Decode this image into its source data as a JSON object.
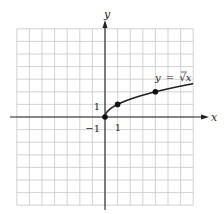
{
  "chart_data": {
    "type": "line",
    "title": "",
    "function_label": "y = √x",
    "function_label_parts": {
      "lhs": "y",
      "eq": "=",
      "radical": "√",
      "radicand": "x"
    },
    "xlabel": "x",
    "ylabel": "y",
    "xlim": [
      -7,
      7
    ],
    "ylim": [
      -7,
      7
    ],
    "grid": true,
    "grid_step": 1,
    "tick_labels": {
      "x": [
        {
          "value": 1,
          "label": "1"
        }
      ],
      "y": [
        {
          "value": 1,
          "label": "1"
        },
        {
          "value": -1,
          "label": "-1"
        }
      ]
    },
    "tick_label_text": {
      "x_one": "1",
      "y_one": "1",
      "y_neg_one": "−1"
    },
    "series": [
      {
        "name": "y = √x",
        "x": [
          0,
          0.25,
          0.5,
          1,
          1.5,
          2,
          2.5,
          3,
          3.5,
          4,
          4.5,
          5,
          5.5,
          6,
          6.5,
          7
        ],
        "y": [
          0,
          0.5,
          0.707,
          1,
          1.225,
          1.414,
          1.581,
          1.732,
          1.871,
          2,
          2.121,
          2.236,
          2.345,
          2.449,
          2.55,
          2.646
        ]
      }
    ],
    "highlighted_points": [
      {
        "x": 0,
        "y": 0
      },
      {
        "x": 1,
        "y": 1
      },
      {
        "x": 4,
        "y": 2
      }
    ],
    "colors": {
      "grid": "#c8c8c8",
      "axis": "#222222",
      "curve": "#222222",
      "points": "#111111"
    }
  }
}
